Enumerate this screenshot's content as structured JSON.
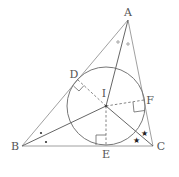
{
  "diagram": {
    "points": {
      "A": {
        "label": "A",
        "x": 128,
        "y": 20
      },
      "B": {
        "label": "B",
        "x": 22,
        "y": 146
      },
      "C": {
        "label": "C",
        "x": 153,
        "y": 146
      },
      "I": {
        "label": "I",
        "x": 106,
        "y": 106
      },
      "D": {
        "label": "D",
        "x": 78,
        "y": 80
      },
      "E": {
        "label": "E",
        "x": 106,
        "y": 145
      },
      "F": {
        "label": "F",
        "x": 144,
        "y": 100
      }
    },
    "incircle": {
      "cx": 106,
      "cy": 106,
      "r": 39
    },
    "angle_marks": {
      "A": "small circles (equal halves of angle A)",
      "B": "dots (equal halves of angle B)",
      "C": "stars (equal halves of angle C)"
    },
    "right_angles": [
      "D",
      "E",
      "F"
    ],
    "marks": {
      "A_mark": "∘",
      "B_mark": "•",
      "C_mark": "★"
    }
  }
}
